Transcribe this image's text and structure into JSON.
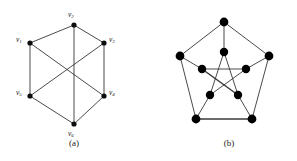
{
  "figure": {
    "background_color": "#ffffff",
    "ink_color": "#1a1a1a",
    "edge_color": "#2b2b2b",
    "node_color": "#000000",
    "panels": [
      {
        "id": "panel-a",
        "caption": "(a)",
        "caption_pos": {
          "x": 74,
          "y": 146
        },
        "graph_type": "hexagon-with-three-main-diagonals",
        "nodes": [
          {
            "id": "v2",
            "label": "v",
            "sub": "2",
            "x": 74,
            "y": 25,
            "r": 2.6,
            "label_x": 68,
            "label_y": 17
          },
          {
            "id": "v3",
            "label": "v",
            "sub": "3",
            "x": 104,
            "y": 43,
            "r": 2.6,
            "label_x": 109,
            "label_y": 42
          },
          {
            "id": "v4",
            "label": "v",
            "sub": "4",
            "x": 104,
            "y": 96,
            "r": 2.6,
            "label_x": 109,
            "label_y": 95
          },
          {
            "id": "v6",
            "label": "v",
            "sub": "6",
            "x": 74,
            "y": 124,
            "r": 2.6,
            "label_x": 68,
            "label_y": 136
          },
          {
            "id": "v5",
            "label": "v",
            "sub": "5",
            "x": 30,
            "y": 96,
            "r": 2.6,
            "label_x": 16,
            "label_y": 95
          },
          {
            "id": "v1",
            "label": "v",
            "sub": "1",
            "x": 30,
            "y": 43,
            "r": 2.6,
            "label_x": 16,
            "label_y": 42
          }
        ],
        "edges": [
          {
            "from": "v2",
            "to": "v3"
          },
          {
            "from": "v3",
            "to": "v4"
          },
          {
            "from": "v4",
            "to": "v6"
          },
          {
            "from": "v6",
            "to": "v5"
          },
          {
            "from": "v5",
            "to": "v1"
          },
          {
            "from": "v1",
            "to": "v2"
          },
          {
            "from": "v2",
            "to": "v6"
          },
          {
            "from": "v1",
            "to": "v4"
          },
          {
            "from": "v3",
            "to": "v5"
          }
        ]
      },
      {
        "id": "panel-b",
        "caption": "(b)",
        "caption_pos": {
          "x": 229,
          "y": 146
        },
        "graph_type": "petersen-graph",
        "nodes": [
          {
            "id": "o1",
            "ring": "outer",
            "x": 224,
            "y": 22,
            "r": 4.4
          },
          {
            "id": "o2",
            "ring": "outer",
            "x": 269,
            "y": 56,
            "r": 4.4
          },
          {
            "id": "o3",
            "ring": "outer",
            "x": 252,
            "y": 119,
            "r": 4.4
          },
          {
            "id": "o4",
            "ring": "outer",
            "x": 196,
            "y": 119,
            "r": 4.4
          },
          {
            "id": "o5",
            "ring": "outer",
            "x": 180,
            "y": 56,
            "r": 4.4
          },
          {
            "id": "i1",
            "ring": "inner",
            "x": 224,
            "y": 52,
            "r": 4.2
          },
          {
            "id": "i2",
            "ring": "inner",
            "x": 246,
            "y": 69,
            "r": 4.2
          },
          {
            "id": "i3",
            "ring": "inner",
            "x": 238,
            "y": 95,
            "r": 4.2
          },
          {
            "id": "i4",
            "ring": "inner",
            "x": 210,
            "y": 95,
            "r": 4.2
          },
          {
            "id": "i5",
            "ring": "inner",
            "x": 202,
            "y": 69,
            "r": 4.2
          }
        ],
        "edges": [
          {
            "from": "o1",
            "to": "o2",
            "weight": "thin"
          },
          {
            "from": "o2",
            "to": "o3",
            "weight": "thin"
          },
          {
            "from": "o3",
            "to": "o4",
            "weight": "thick"
          },
          {
            "from": "o4",
            "to": "o5",
            "weight": "thin"
          },
          {
            "from": "o5",
            "to": "o1",
            "weight": "thin"
          },
          {
            "from": "o1",
            "to": "i1",
            "weight": "thin"
          },
          {
            "from": "o2",
            "to": "i2",
            "weight": "thin"
          },
          {
            "from": "o3",
            "to": "i3",
            "weight": "thin"
          },
          {
            "from": "o4",
            "to": "i4",
            "weight": "thin"
          },
          {
            "from": "o5",
            "to": "i5",
            "weight": "thin"
          },
          {
            "from": "i1",
            "to": "i3",
            "weight": "thin"
          },
          {
            "from": "i3",
            "to": "i5",
            "weight": "thick"
          },
          {
            "from": "i5",
            "to": "i2",
            "weight": "thin"
          },
          {
            "from": "i2",
            "to": "i4",
            "weight": "thin"
          },
          {
            "from": "i4",
            "to": "i1",
            "weight": "thin"
          }
        ]
      }
    ]
  }
}
